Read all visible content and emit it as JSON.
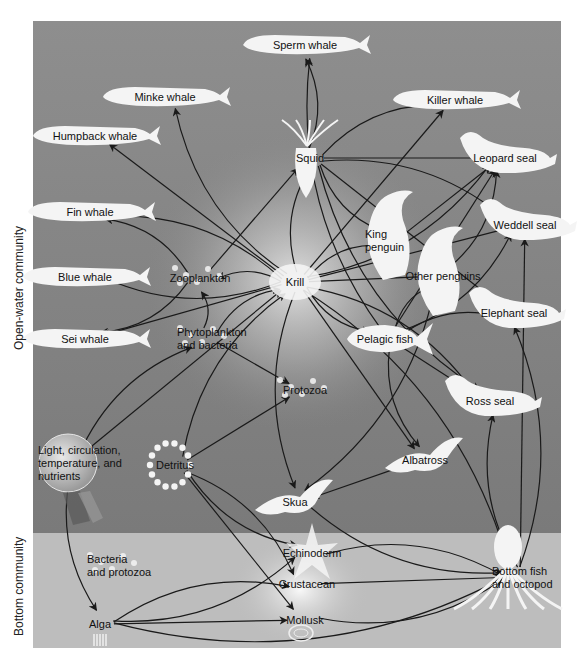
{
  "diagram": {
    "colors": {
      "open_water_top": "#8a8a8a",
      "open_water_bottom": "#7c7c7c",
      "bottom_zone": "#bdbdbd",
      "glow": "#ffffff",
      "arrow": "#1a1a1a",
      "silhouette": "#f4f4f4"
    },
    "zones": [
      {
        "id": "open-water",
        "label": "Open-water community"
      },
      {
        "id": "bottom",
        "label": "Bottom community"
      }
    ],
    "nodes": [
      {
        "id": "sperm-whale",
        "label": "Sperm whale",
        "x": 305,
        "y": 45,
        "shape": "whale",
        "zone": "open-water"
      },
      {
        "id": "minke-whale",
        "label": "Minke whale",
        "x": 165,
        "y": 97,
        "shape": "whale",
        "zone": "open-water"
      },
      {
        "id": "killer-whale",
        "label": "Killer whale",
        "x": 455,
        "y": 100,
        "shape": "whale",
        "zone": "open-water"
      },
      {
        "id": "humpback-whale",
        "label": "Humpback whale",
        "x": 95,
        "y": 136,
        "shape": "whale",
        "zone": "open-water"
      },
      {
        "id": "squid",
        "label": "Squid",
        "x": 310,
        "y": 158,
        "shape": "squid",
        "zone": "open-water"
      },
      {
        "id": "leopard-seal",
        "label": "Leopard seal",
        "x": 505,
        "y": 158,
        "shape": "seal",
        "zone": "open-water"
      },
      {
        "id": "fin-whale",
        "label": "Fin whale",
        "x": 90,
        "y": 212,
        "shape": "whale",
        "zone": "open-water"
      },
      {
        "id": "king-penguin",
        "label": "King penguin",
        "x": 393,
        "y": 240,
        "shape": "penguin",
        "zone": "open-water"
      },
      {
        "id": "weddell-seal",
        "label": "Weddell seal",
        "x": 525,
        "y": 225,
        "shape": "seal",
        "zone": "open-water"
      },
      {
        "id": "blue-whale",
        "label": "Blue whale",
        "x": 85,
        "y": 277,
        "shape": "whale",
        "zone": "open-water"
      },
      {
        "id": "zooplankton",
        "label": "Zooplankton",
        "x": 200,
        "y": 278,
        "shape": "plankton",
        "zone": "open-water"
      },
      {
        "id": "krill",
        "label": "Krill",
        "x": 295,
        "y": 282,
        "shape": "krill",
        "zone": "open-water"
      },
      {
        "id": "other-penguins",
        "label": "Other penguins",
        "x": 443,
        "y": 276,
        "shape": "penguin",
        "zone": "open-water"
      },
      {
        "id": "elephant-seal",
        "label": "Elephant seal",
        "x": 514,
        "y": 313,
        "shape": "seal",
        "zone": "open-water"
      },
      {
        "id": "sei-whale",
        "label": "Sei whale",
        "x": 85,
        "y": 339,
        "shape": "whale",
        "zone": "open-water"
      },
      {
        "id": "phytoplankton",
        "label": "Phytoplankton and bacteria",
        "x": 205,
        "y": 338,
        "shape": "plankton",
        "zone": "open-water"
      },
      {
        "id": "pelagic-fish",
        "label": "Pelagic fish",
        "x": 385,
        "y": 339,
        "shape": "fish",
        "zone": "open-water"
      },
      {
        "id": "protozoa",
        "label": "Protozoa",
        "x": 305,
        "y": 390,
        "shape": "plankton",
        "zone": "open-water"
      },
      {
        "id": "ross-seal",
        "label": "Ross seal",
        "x": 490,
        "y": 401,
        "shape": "seal",
        "zone": "open-water"
      },
      {
        "id": "light",
        "label": "Light, circulation, temperature, and nutrients",
        "x": 68,
        "y": 463,
        "shape": "sphere",
        "zone": "open-water"
      },
      {
        "id": "detritus",
        "label": "Detritus",
        "x": 175,
        "y": 465,
        "shape": "dots",
        "zone": "open-water"
      },
      {
        "id": "albatross",
        "label": "Albatross",
        "x": 425,
        "y": 460,
        "shape": "bird",
        "zone": "open-water"
      },
      {
        "id": "skua",
        "label": "Skua",
        "x": 295,
        "y": 502,
        "shape": "bird",
        "zone": "open-water"
      },
      {
        "id": "bacteria-protozoa",
        "label": "Bacteria and protozoa",
        "x": 115,
        "y": 565,
        "shape": "plankton",
        "zone": "bottom"
      },
      {
        "id": "echinoderm",
        "label": "Echinoderm",
        "x": 312,
        "y": 553,
        "shape": "star",
        "zone": "bottom"
      },
      {
        "id": "bottom-fish-octopod",
        "label": "Bottom fish and octopod",
        "x": 520,
        "y": 577,
        "shape": "octopus",
        "zone": "bottom"
      },
      {
        "id": "crustacean",
        "label": "Crustacean",
        "x": 307,
        "y": 584,
        "shape": "none",
        "zone": "bottom"
      },
      {
        "id": "alga",
        "label": "Alga",
        "x": 100,
        "y": 624,
        "shape": "alga",
        "zone": "bottom"
      },
      {
        "id": "mollusk",
        "label": "Mollusk",
        "x": 305,
        "y": 620,
        "shape": "shell",
        "zone": "bottom"
      }
    ],
    "edges": [
      [
        "krill",
        "minke-whale"
      ],
      [
        "krill",
        "humpback-whale"
      ],
      [
        "krill",
        "fin-whale"
      ],
      [
        "krill",
        "blue-whale"
      ],
      [
        "krill",
        "sei-whale"
      ],
      [
        "krill",
        "zooplankton"
      ],
      [
        "krill",
        "squid"
      ],
      [
        "krill",
        "killer-whale"
      ],
      [
        "krill",
        "leopard-seal"
      ],
      [
        "krill",
        "king-penguin"
      ],
      [
        "krill",
        "other-penguins"
      ],
      [
        "krill",
        "pelagic-fish"
      ],
      [
        "krill",
        "ross-seal"
      ],
      [
        "krill",
        "albatross"
      ],
      [
        "krill",
        "skua"
      ],
      [
        "krill",
        "bottom-fish-octopod"
      ],
      [
        "krill",
        "weddell-seal"
      ],
      [
        "zooplankton",
        "fin-whale"
      ],
      [
        "zooplankton",
        "sei-whale"
      ],
      [
        "zooplankton",
        "squid"
      ],
      [
        "phytoplankton",
        "zooplankton"
      ],
      [
        "phytoplankton",
        "krill"
      ],
      [
        "phytoplankton",
        "protozoa"
      ],
      [
        "squid",
        "sperm-whale"
      ],
      [
        "squid",
        "killer-whale"
      ],
      [
        "squid",
        "leopard-seal"
      ],
      [
        "squid",
        "king-penguin"
      ],
      [
        "squid",
        "weddell-seal"
      ],
      [
        "squid",
        "elephant-seal"
      ],
      [
        "squid",
        "ross-seal"
      ],
      [
        "pelagic-fish",
        "sperm-whale"
      ],
      [
        "pelagic-fish",
        "leopard-seal"
      ],
      [
        "pelagic-fish",
        "weddell-seal"
      ],
      [
        "pelagic-fish",
        "elephant-seal"
      ],
      [
        "pelagic-fish",
        "ross-seal"
      ],
      [
        "pelagic-fish",
        "albatross"
      ],
      [
        "pelagic-fish",
        "other-penguins"
      ],
      [
        "king-penguin",
        "leopard-seal"
      ],
      [
        "other-penguins",
        "leopard-seal"
      ],
      [
        "other-penguins",
        "skua"
      ],
      [
        "albatross",
        "skua"
      ],
      [
        "skua",
        "bottom-fish-octopod"
      ],
      [
        "light",
        "phytoplankton"
      ],
      [
        "light",
        "krill"
      ],
      [
        "light",
        "alga"
      ],
      [
        "detritus",
        "krill"
      ],
      [
        "detritus",
        "protozoa"
      ],
      [
        "detritus",
        "echinoderm"
      ],
      [
        "detritus",
        "crustacean"
      ],
      [
        "detritus",
        "mollusk"
      ],
      [
        "alga",
        "echinoderm"
      ],
      [
        "alga",
        "crustacean"
      ],
      [
        "alga",
        "mollusk"
      ],
      [
        "alga",
        "bottom-fish-octopod"
      ],
      [
        "echinoderm",
        "bottom-fish-octopod"
      ],
      [
        "crustacean",
        "bottom-fish-octopod"
      ],
      [
        "mollusk",
        "bottom-fish-octopod"
      ],
      [
        "bottom-fish-octopod",
        "ross-seal"
      ],
      [
        "bottom-fish-octopod",
        "weddell-seal"
      ],
      [
        "bottom-fish-octopod",
        "elephant-seal"
      ]
    ]
  }
}
